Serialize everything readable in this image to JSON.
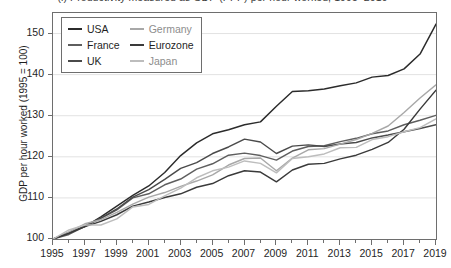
{
  "figure": {
    "title": "(l) Productivity measured as GDP (PPP) per hour worked, 1995–2019"
  },
  "chart_data": {
    "type": "line",
    "title": "(l) Productivity measured as GDP (PPP) per hour worked, 1995–2019",
    "xlabel": "",
    "ylabel": "GDP per hour worked (1995 = 100)",
    "xlim": [
      1995,
      2019
    ],
    "ylim": [
      100,
      155
    ],
    "grid": "horizontal",
    "legend_position": "top-left-inside",
    "y_ticks": [
      100,
      110,
      120,
      130,
      140,
      150
    ],
    "x_ticks": [
      1995,
      1997,
      1999,
      2001,
      2003,
      2005,
      2007,
      2009,
      2011,
      2013,
      2015,
      2017,
      2019
    ],
    "x_minor_ticks": [
      1996,
      1998,
      2000,
      2002,
      2004,
      2006,
      2008,
      2010,
      2012,
      2014,
      2016,
      2018
    ],
    "x": [
      1995,
      1996,
      1997,
      1998,
      1999,
      2000,
      2001,
      2002,
      2003,
      2004,
      2005,
      2006,
      2007,
      2008,
      2009,
      2010,
      2011,
      2012,
      2013,
      2014,
      2015,
      2016,
      2017,
      2018,
      2019
    ],
    "series": [
      {
        "name": "USA",
        "color": "#2b2b2b",
        "values": [
          100.0,
          101.6,
          103.0,
          105.4,
          108.0,
          110.6,
          112.9,
          116.2,
          120.3,
          123.4,
          125.6,
          126.6,
          127.8,
          128.5,
          132.3,
          135.9,
          136.1,
          136.5,
          137.3,
          138.0,
          139.4,
          139.8,
          141.4,
          145.0,
          152.3
        ]
      },
      {
        "name": "France",
        "color": "#5e5e5e",
        "values": [
          100.0,
          101.1,
          103.1,
          105.0,
          107.1,
          110.0,
          111.0,
          113.2,
          114.6,
          117.0,
          118.3,
          120.4,
          120.9,
          120.3,
          119.2,
          121.4,
          122.5,
          122.7,
          123.7,
          124.5,
          125.6,
          126.3,
          127.8,
          128.9,
          130.1
        ]
      },
      {
        "name": "UK",
        "color": "#4a4a4a",
        "values": [
          100.0,
          101.5,
          103.2,
          105.1,
          107.3,
          110.2,
          112.0,
          114.5,
          117.2,
          118.6,
          120.8,
          122.4,
          124.3,
          123.6,
          120.8,
          122.6,
          122.9,
          122.5,
          123.1,
          123.5,
          124.6,
          125.3,
          126.1,
          126.9,
          127.8
        ]
      },
      {
        "name": "Germany",
        "color": "#a8a8a8",
        "values": [
          100.0,
          101.7,
          103.7,
          104.7,
          106.5,
          108.5,
          110.2,
          111.3,
          112.8,
          114.1,
          115.6,
          118.0,
          119.6,
          119.7,
          116.6,
          119.7,
          121.7,
          122.0,
          123.1,
          124.2,
          125.7,
          127.5,
          130.8,
          134.3,
          137.5
        ]
      },
      {
        "name": "Eurozone",
        "color": "#3a3a3a",
        "values": [
          100.0,
          101.4,
          103.0,
          104.3,
          105.9,
          108.0,
          109.0,
          110.1,
          111.0,
          112.6,
          113.5,
          115.4,
          116.6,
          116.3,
          113.9,
          116.8,
          118.2,
          118.4,
          119.5,
          120.4,
          121.8,
          123.5,
          126.7,
          131.6,
          136.2
        ]
      },
      {
        "name": "Japan",
        "color": "#bdbdbd",
        "values": [
          100.0,
          102.2,
          103.4,
          103.4,
          104.9,
          107.8,
          108.4,
          110.5,
          112.4,
          114.9,
          116.6,
          117.5,
          119.0,
          118.4,
          116.1,
          119.6,
          120.0,
          120.7,
          122.2,
          122.3,
          124.2,
          124.9,
          126.1,
          127.1,
          129.2
        ]
      }
    ]
  },
  "axis": {
    "y_title": "GDP per hour worked (1995 = 100)",
    "y_labels": [
      "150",
      "140",
      "130",
      "120",
      "110",
      "100"
    ],
    "x_labels": [
      "1995",
      "1997",
      "1999",
      "2001",
      "2003",
      "2005",
      "2007",
      "2009",
      "2011",
      "2013",
      "2015",
      "2017",
      "2019"
    ]
  },
  "legend": {
    "entries": [
      {
        "label": "USA",
        "color": "#2b2b2b"
      },
      {
        "label": "Germany",
        "color": "#a8a8a8"
      },
      {
        "label": "France",
        "color": "#5e5e5e"
      },
      {
        "label": "Eurozone",
        "color": "#3a3a3a"
      },
      {
        "label": "UK",
        "color": "#4a4a4a"
      },
      {
        "label": "Japan",
        "color": "#bdbdbd"
      }
    ]
  }
}
